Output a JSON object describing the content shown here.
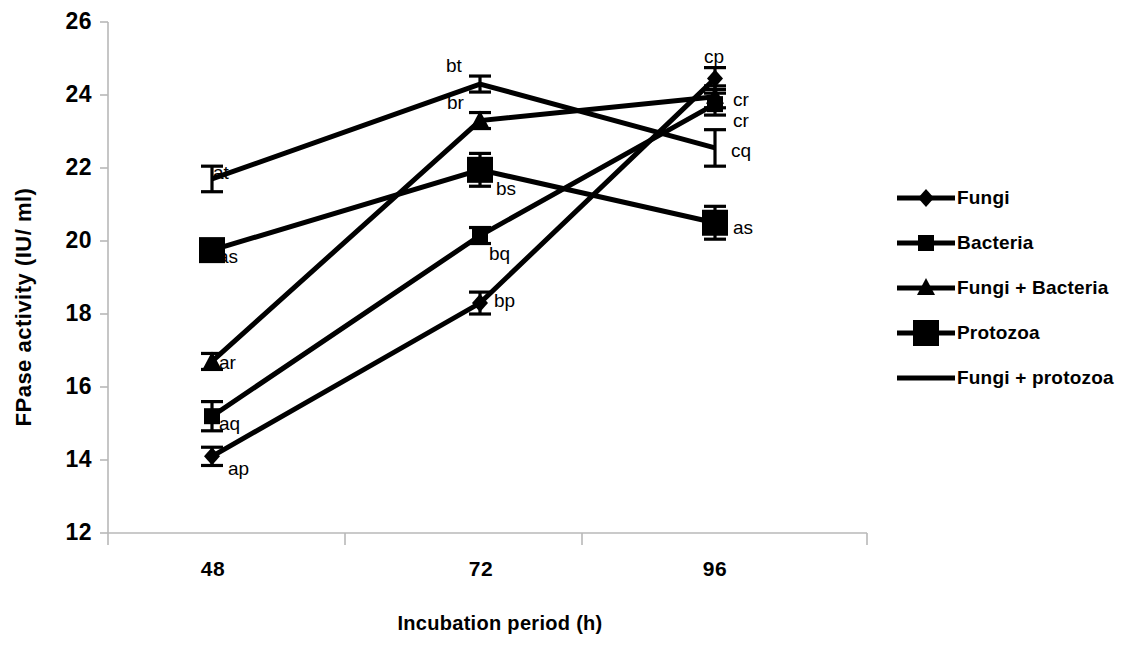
{
  "chart_data": {
    "type": "line",
    "title": "",
    "xlabel": "Incubation period (h)",
    "ylabel": "FPase activity (IU/ ml)",
    "categories": [
      "48",
      "72",
      "96"
    ],
    "x": [
      48,
      72,
      96
    ],
    "xlim": [
      36,
      108
    ],
    "ylim": [
      12,
      26
    ],
    "yticks": [
      "12",
      "14",
      "16",
      "18",
      "20",
      "22",
      "24",
      "26"
    ],
    "ytick_values": [
      12,
      14,
      16,
      18,
      20,
      22,
      24,
      26
    ],
    "grid": false,
    "legend_position": "right",
    "series": [
      {
        "name": "Fungi",
        "marker": "diamond",
        "values": [
          14.1,
          18.3,
          24.45
        ],
        "errors": [
          0.25,
          0.3,
          0.3
        ],
        "point_labels": [
          "ap",
          "bp",
          "cp"
        ]
      },
      {
        "name": "Bacteria",
        "marker": "square-small",
        "values": [
          15.2,
          20.15,
          23.75
        ],
        "errors": [
          0.4,
          0.15,
          0.3
        ],
        "point_labels": [
          "aq",
          "bq",
          "cr"
        ]
      },
      {
        "name": "Fungi + Bacteria",
        "marker": "triangle",
        "values": [
          16.7,
          23.3,
          23.95
        ],
        "errors": [
          0.15,
          0.2,
          0.3
        ],
        "point_labels": [
          "ar",
          "br",
          "cr"
        ]
      },
      {
        "name": "Protozoa",
        "marker": "square-large",
        "values": [
          19.75,
          21.95,
          20.5
        ],
        "errors": [
          0.25,
          0.45,
          0.45
        ],
        "point_labels": [
          "as",
          "bs",
          "as"
        ]
      },
      {
        "name": "Fungi + protozoa",
        "marker": "line",
        "values": [
          21.7,
          24.3,
          22.55
        ],
        "errors": [
          0.35,
          0.2,
          0.5
        ],
        "point_labels": [
          "at",
          "bt",
          "cq"
        ]
      }
    ]
  },
  "axis": {
    "y_title": "FPase activity (IU/ ml)",
    "x_title": "Incubation period (h)",
    "ytick_0": "12",
    "ytick_1": "14",
    "ytick_2": "16",
    "ytick_3": "18",
    "ytick_4": "20",
    "ytick_5": "22",
    "ytick_6": "24",
    "ytick_7": "26",
    "xtick_0": "48",
    "xtick_1": "72",
    "xtick_2": "96"
  },
  "annotations": {
    "at": "at",
    "as_48": "as",
    "ar": "ar",
    "aq": "aq",
    "ap": "ap",
    "bt": "bt",
    "br": "br",
    "bs": "bs",
    "bq": "bq",
    "bp": "bp",
    "cp": "cp",
    "cr_upper": "cr",
    "cr_lower": "cr",
    "cq": "cq",
    "as_96": "as"
  },
  "legend": {
    "items": [
      {
        "label": "Fungi",
        "marker": "diamond"
      },
      {
        "label": "Bacteria",
        "marker": "square-small"
      },
      {
        "label": "Fungi + Bacteria",
        "marker": "triangle"
      },
      {
        "label": "Protozoa",
        "marker": "square-large"
      },
      {
        "label": "Fungi + protozoa",
        "marker": "line"
      }
    ]
  },
  "colors": {
    "series": "#000000",
    "axis": "#b0b0b0",
    "text": "#000000",
    "background": "#ffffff"
  }
}
